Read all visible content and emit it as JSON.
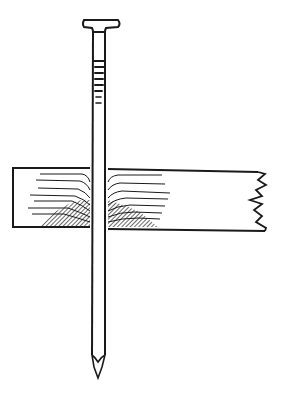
{
  "illustration": {
    "subject": "Nail driven through a wooden board",
    "ink_color": "#1a1a1a",
    "background_color": "#ffffff",
    "parts": [
      "nail-head",
      "nail-shank",
      "grip-rings",
      "nail-point",
      "board",
      "wood-grain",
      "compressed-fibers",
      "broken-board-end"
    ]
  }
}
